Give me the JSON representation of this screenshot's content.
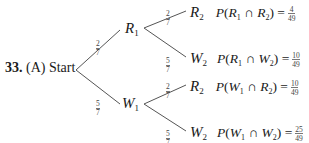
{
  "problem": {
    "number": "33.",
    "part": "(A)",
    "root_label": "Start"
  },
  "level1": [
    {
      "name": "R",
      "sub": "1",
      "branch_prob": {
        "num": "2",
        "den": "7"
      }
    },
    {
      "name": "W",
      "sub": "1",
      "branch_prob": {
        "num": "5",
        "den": "7"
      }
    }
  ],
  "level2": [
    {
      "parent": "R1",
      "name": "R",
      "sub": "2",
      "branch_prob": {
        "num": "2",
        "den": "7"
      },
      "joint": {
        "a": "R",
        "a_sub": "1",
        "b": "R",
        "b_sub": "2",
        "num": "4",
        "den": "49"
      }
    },
    {
      "parent": "R1",
      "name": "W",
      "sub": "2",
      "branch_prob": {
        "num": "5",
        "den": "7"
      },
      "joint": {
        "a": "R",
        "a_sub": "1",
        "b": "W",
        "b_sub": "2",
        "num": "10",
        "den": "49"
      }
    },
    {
      "parent": "W1",
      "name": "R",
      "sub": "2",
      "branch_prob": {
        "num": "2",
        "den": "7"
      },
      "joint": {
        "a": "W",
        "a_sub": "1",
        "b": "R",
        "b_sub": "2",
        "num": "10",
        "den": "49"
      }
    },
    {
      "parent": "W1",
      "name": "W",
      "sub": "2",
      "branch_prob": {
        "num": "5",
        "den": "7"
      },
      "joint": {
        "a": "W",
        "a_sub": "1",
        "b": "W",
        "b_sub": "2",
        "num": "25",
        "den": "49"
      }
    }
  ],
  "symbols": {
    "prob": "P",
    "cap": "∩",
    "eq": "="
  }
}
